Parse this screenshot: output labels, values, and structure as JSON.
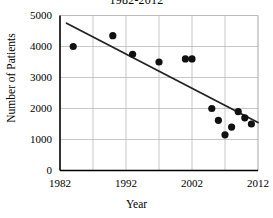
{
  "chart_data": {
    "type": "scatter",
    "title": "1982-2012",
    "xlabel": "Year",
    "ylabel": "Number of Patients",
    "xlim": [
      1982,
      2012
    ],
    "ylim": [
      0,
      5000
    ],
    "xticks": [
      1982,
      1992,
      2002,
      2012
    ],
    "yticks": [
      0,
      1000,
      2000,
      3000,
      4000,
      5000
    ],
    "x_minor_gridline_interval": 5,
    "grid": true,
    "legend": "none",
    "series": [
      {
        "name": "Number of Patients",
        "marker": "filled-circle",
        "color": "#111111",
        "points": [
          {
            "x": 1984,
            "y": 4000
          },
          {
            "x": 1990,
            "y": 4350
          },
          {
            "x": 1993,
            "y": 3750
          },
          {
            "x": 1997,
            "y": 3500
          },
          {
            "x": 2001,
            "y": 3600
          },
          {
            "x": 2002,
            "y": 3600
          },
          {
            "x": 2005,
            "y": 2000
          },
          {
            "x": 2006,
            "y": 1620
          },
          {
            "x": 2007,
            "y": 1150
          },
          {
            "x": 2008,
            "y": 1400
          },
          {
            "x": 2009,
            "y": 1900
          },
          {
            "x": 2010,
            "y": 1700
          },
          {
            "x": 2011,
            "y": 1500
          }
        ]
      }
    ],
    "trendline": {
      "type": "linear",
      "color": "#222222",
      "x_start": 1983,
      "y_start": 4750,
      "x_end": 2012,
      "y_end": 1550
    }
  },
  "axes": {
    "y_tick_labels": [
      "5000",
      "4000",
      "3000",
      "2000",
      "1000",
      "0"
    ],
    "x_tick_labels": [
      "1982",
      "1992",
      "2002",
      "2012"
    ]
  }
}
